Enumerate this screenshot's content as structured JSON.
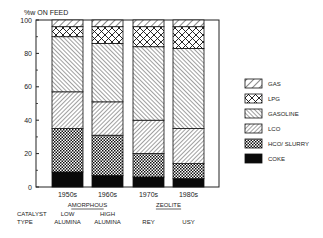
{
  "chart_data": {
    "type": "bar",
    "stacked": true,
    "title": "",
    "ylabel": "%w ON FEED",
    "xlabel": "",
    "ylim": [
      0,
      100
    ],
    "yticks": [
      0,
      20,
      40,
      60,
      80,
      100
    ],
    "grid": false,
    "legend_position": "right",
    "categories": [
      "1950s",
      "1960s",
      "1970s",
      "1980s"
    ],
    "series": [
      {
        "name": "COKE",
        "pattern": "solid-black",
        "values": [
          9,
          7,
          6,
          5
        ]
      },
      {
        "name": "HCO/ SLURRY",
        "pattern": "checker",
        "values": [
          26,
          24,
          14,
          9
        ]
      },
      {
        "name": "LCO",
        "pattern": "dense-forward-hatch",
        "values": [
          22,
          20,
          20,
          21
        ]
      },
      {
        "name": "GASOLINE",
        "pattern": "back-hatch",
        "values": [
          33,
          35,
          44,
          48
        ]
      },
      {
        "name": "LPG",
        "pattern": "crosshatch",
        "values": [
          6,
          10,
          12,
          13
        ]
      },
      {
        "name": "GAS",
        "pattern": "sparse-forward-hatch",
        "values": [
          4,
          4,
          4,
          4
        ]
      }
    ],
    "legend_order": [
      "GAS",
      "LPG",
      "GASOLINE",
      "LCO",
      "HCO/ SLURRY",
      "COKE"
    ],
    "catalyst_label": [
      "CATALYST",
      "TYPE"
    ],
    "groups": [
      {
        "name": "AMORPHOUS",
        "categories": [
          "1950s",
          "1960s"
        ]
      },
      {
        "name": "ZEOLITE",
        "categories": [
          "1970s",
          "1980s"
        ]
      }
    ],
    "catalyst_types": [
      [
        "LOW",
        "ALUMINA"
      ],
      [
        "HIGH",
        "ALUMINA"
      ],
      [
        "REY"
      ],
      [
        "USY"
      ]
    ]
  }
}
